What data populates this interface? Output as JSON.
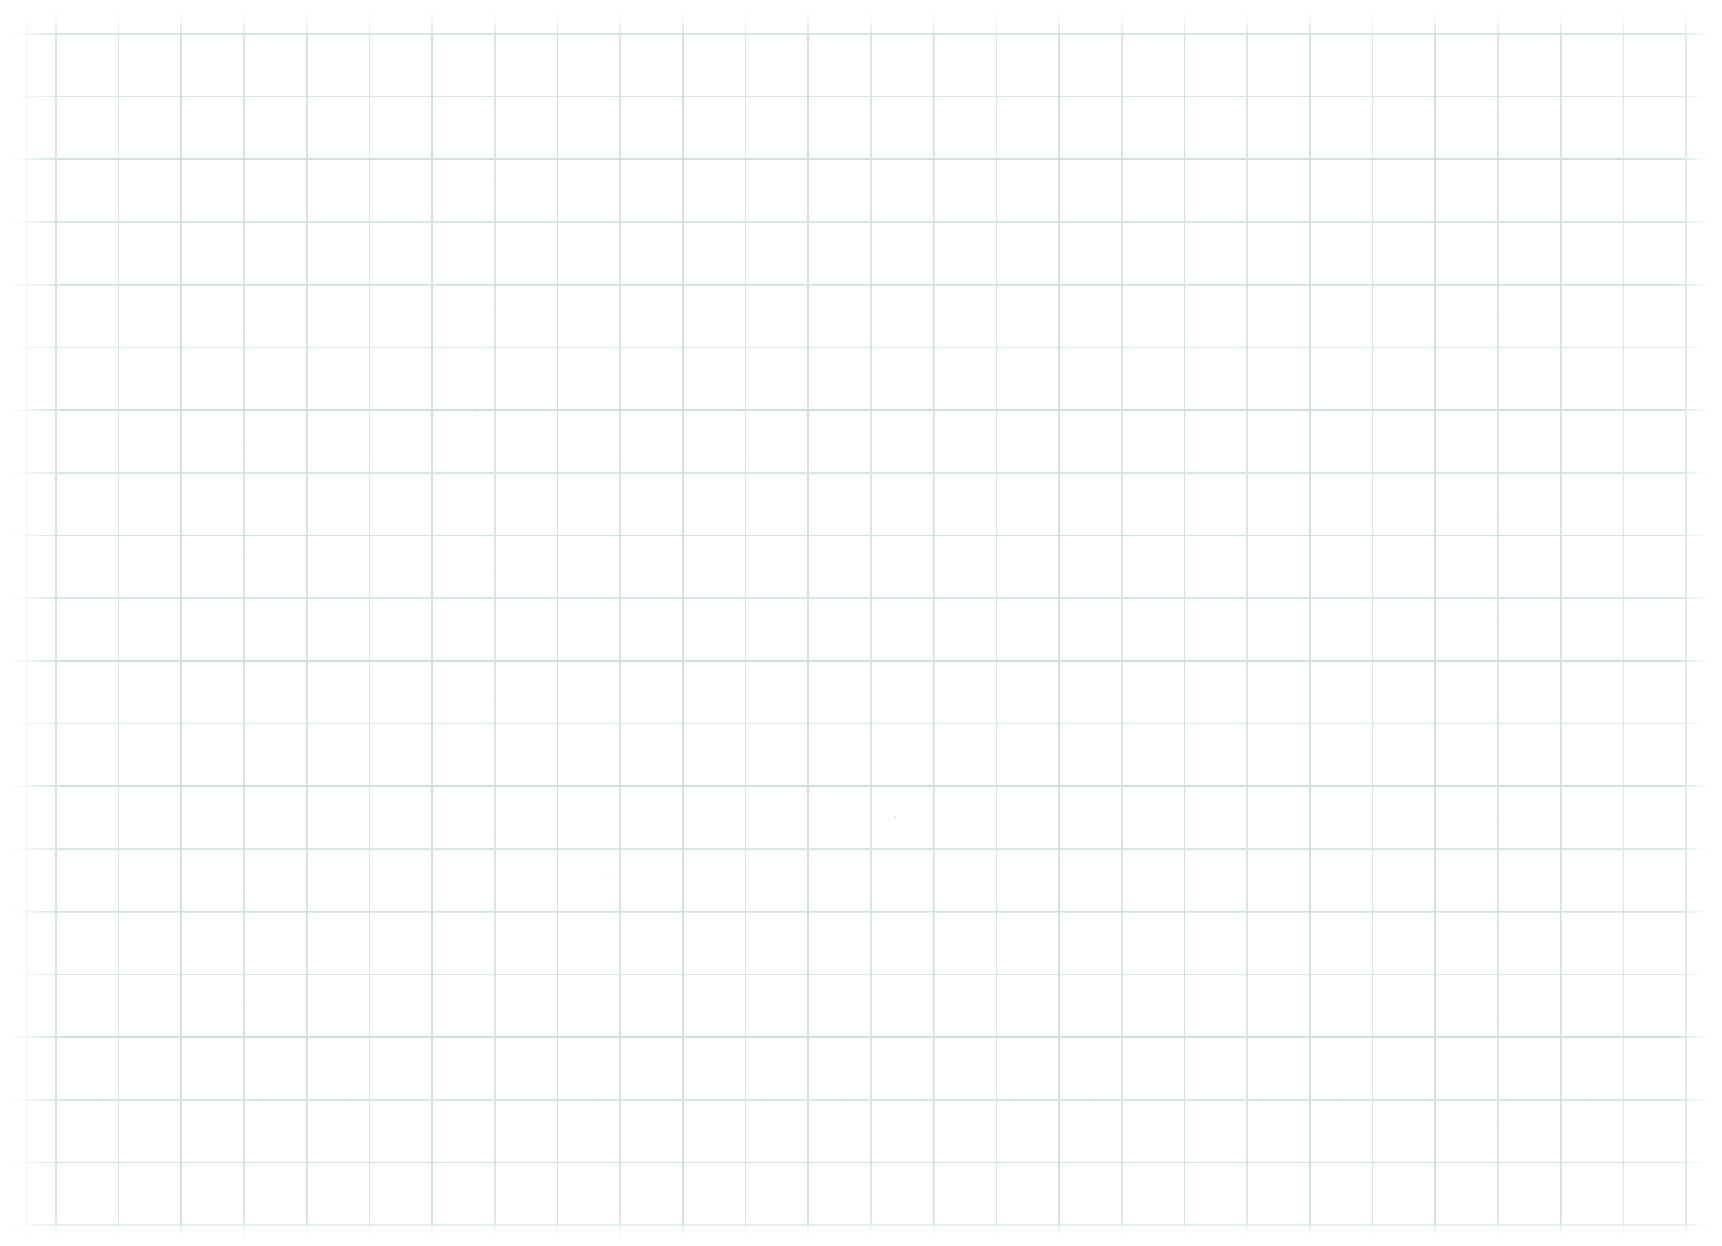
{
  "document": {
    "kind": "graph-paper-scan",
    "title": "Blank graph paper",
    "description": "Scanned sheet of blank square-ruled graph paper. No handwriting, printed text, figures or annotations are present.",
    "width_px": 1722,
    "height_px": 1246,
    "orientation": "landscape",
    "visible_text": ""
  },
  "paper": {
    "background_color": "#ffffff",
    "tint_color": "#fdfdfc",
    "has_text": false,
    "has_drawing": false,
    "has_handwriting": false
  },
  "grid": {
    "style": "square-ruled",
    "line_color": "#d8e8e0",
    "line_color_strong": "#c7ded3",
    "line_width_px": 1.6,
    "line_width_strong_px": 1.8,
    "cell_size_px": 62.7,
    "origin_x_px": 55,
    "origin_y_px": 33,
    "columns_visible": 27,
    "rows_visible": 20,
    "grid_left_px": 20,
    "grid_top_px": 30,
    "grid_right_px": 1702,
    "grid_bottom_px": 1228
  },
  "margins": {
    "left_px": 55,
    "right_px": 20,
    "top_px": 33,
    "bottom_px": 18,
    "note": "Grid rulings fade out toward the sheet edges where the scan whites out."
  },
  "specks": [
    {
      "x": 607,
      "y": 873,
      "size": 2
    },
    {
      "x": 894,
      "y": 816,
      "size": 2
    },
    {
      "x": 1121,
      "y": 845,
      "size": 2
    },
    {
      "x": 476,
      "y": 410,
      "size": 2
    },
    {
      "x": 738,
      "y": 409,
      "size": 2
    }
  ]
}
